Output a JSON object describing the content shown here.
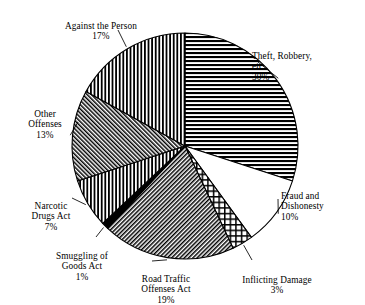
{
  "chart_data": {
    "type": "pie",
    "title": "",
    "subtitle": "",
    "xlabel": "",
    "ylabel": "",
    "grid": false,
    "legend_position": "callout-labels",
    "start_angle_deg": 0,
    "direction": "clockwise",
    "center": {
      "x": 185,
      "y": 146
    },
    "radius": 113,
    "categories": [
      "Theft, Robbery, etc.",
      "Fraud and Dishonesty",
      "Inflicting Damage",
      "Road Traffic Offenses Act",
      "Smuggling of Goods Act",
      "Narcotic Drugs Act",
      "Other Offenses",
      "Against the Person"
    ],
    "values": [
      30,
      10,
      3,
      19,
      1,
      7,
      13,
      17
    ],
    "value_suffix": "%",
    "slices": [
      {
        "id": "theft",
        "label_lines": "Theft, Robbery,\netc.\n30%",
        "name": "Theft, Robbery, etc.",
        "value": 30,
        "value_text": "30%",
        "pattern": "horizontal-lines"
      },
      {
        "id": "fraud",
        "label_lines": "Fraud and\nDishonesty\n10%",
        "name": "Fraud and Dishonesty",
        "value": 10,
        "value_text": "10%",
        "pattern": "solid-white"
      },
      {
        "id": "inflicting-damage",
        "label_lines": "Inflicting Damage\n3%",
        "name": "Inflicting Damage",
        "value": 3,
        "value_text": "3%",
        "pattern": "grid-crosshatch"
      },
      {
        "id": "road-traffic",
        "label_lines": "Road Traffic\nOffenses Act\n19%",
        "name": "Road Traffic Offenses Act",
        "value": 19,
        "value_text": "19%",
        "pattern": "diagonal-hatch-right"
      },
      {
        "id": "smuggling",
        "label_lines": "Smuggling of\nGoods Act\n1%",
        "name": "Smuggling of Goods Act",
        "value": 1,
        "value_text": "1%",
        "pattern": "solid-black"
      },
      {
        "id": "narcotic-drugs",
        "label_lines": "Narcotic\nDrugs Act\n7%",
        "name": "Narcotic Drugs Act",
        "value": 7,
        "value_text": "7%",
        "pattern": "vertical-lines"
      },
      {
        "id": "other-offenses",
        "label_lines": "Other\nOffenses\n13%",
        "name": "Other Offenses",
        "value": 13,
        "value_text": "13%",
        "pattern": "diagonal-hatch-left"
      },
      {
        "id": "against-the-person",
        "label_lines": "Against the Person\n17%",
        "name": "Against the Person",
        "value": 17,
        "value_text": "17%",
        "pattern": "vertical-lines"
      }
    ],
    "colors": {
      "stroke": "#000000",
      "fill_white": "#ffffff",
      "fill_black": "#000000",
      "background": "#ffffff"
    }
  }
}
